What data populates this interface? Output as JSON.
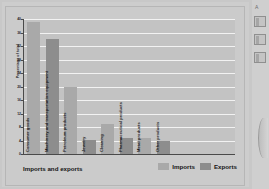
{
  "chart_data": {
    "type": "bar",
    "title": "",
    "xlabel": "Imports and exports",
    "ylabel": "Percentage of total",
    "ylim": [
      0,
      40
    ],
    "yticks": [
      0,
      4,
      8,
      12,
      16,
      20,
      24,
      28,
      32,
      36,
      40
    ],
    "grid": true,
    "legend_position": "bottom-right",
    "legend": [
      "Imports",
      "Exports"
    ],
    "categories": [
      "Consumer goods",
      "Machinery and transportation equipment",
      "Petroleum products",
      "Jewelry",
      "Cleaning",
      "Pharmaceutical products",
      "Metal products",
      "Other products"
    ],
    "series": [
      {
        "name": "Imports",
        "color": "#a9a9a9",
        "values": [
          39,
          null,
          20,
          null,
          9,
          null,
          4.6,
          null
        ]
      },
      {
        "name": "Exports",
        "color": "#8d8d8d",
        "values": [
          null,
          34,
          null,
          4.1,
          null,
          4.8,
          null,
          4.0
        ]
      }
    ],
    "bars": [
      {
        "category": "Consumer goods",
        "series": "Imports",
        "value": 39
      },
      {
        "category": "Machinery and transportation equipment",
        "series": "Exports",
        "value": 34
      },
      {
        "category": "Petroleum products",
        "series": "Imports",
        "value": 20
      },
      {
        "category": "Jewelry",
        "series": "Exports",
        "value": 4.1
      },
      {
        "category": "Cleaning",
        "series": "Imports",
        "value": 9
      },
      {
        "category": "Pharmaceutical products",
        "series": "Exports",
        "value": 4.8
      },
      {
        "category": "Metal products",
        "series": "Imports",
        "value": 4.6
      },
      {
        "category": "Other products",
        "series": "Exports",
        "value": 4.0
      }
    ]
  },
  "footer": {
    "xlabel": "Imports and exports",
    "legend_imports": "Imports",
    "legend_exports": "Exports"
  },
  "axis": {
    "ylabel": "Percentage of total"
  },
  "rail": {
    "marker": "A"
  }
}
